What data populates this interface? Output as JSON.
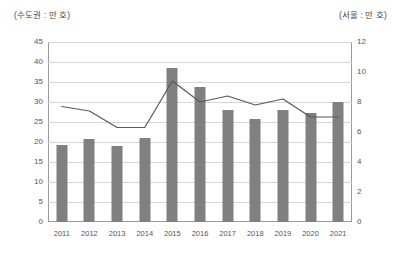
{
  "axis_unit_left": "(수도권 : 만 호)",
  "axis_unit_right": "(서울 : 만 호)",
  "chart_data": {
    "type": "bar",
    "title": "",
    "subtitle": "",
    "xlabel": "",
    "ylabel": "(수도권 : 만 호)",
    "y2label": "(서울 : 만 호)",
    "grid": true,
    "legend": "none",
    "categories": [
      "2011",
      "2012",
      "2013",
      "2014",
      "2015",
      "2016",
      "2017",
      "2018",
      "2019",
      "2020",
      "2021"
    ],
    "ylim": [
      0,
      45
    ],
    "yticks": [
      0,
      5,
      10,
      15,
      20,
      25,
      30,
      35,
      40,
      45
    ],
    "y2lim": [
      0,
      12
    ],
    "y2ticks": [
      0,
      2,
      4,
      6,
      8,
      10,
      12
    ],
    "series": [
      {
        "name": "수도권",
        "type": "bar",
        "axis": "left",
        "color": "#808080",
        "values": [
          19.3,
          20.7,
          19.0,
          21.0,
          38.5,
          33.7,
          28.0,
          25.8,
          28.1,
          27.2,
          30.1
        ]
      },
      {
        "name": "서울",
        "type": "line",
        "axis": "right",
        "color": "#595959",
        "values": [
          7.7,
          7.4,
          6.3,
          6.3,
          9.4,
          8.0,
          8.4,
          7.8,
          8.2,
          7.0,
          7.0
        ]
      }
    ]
  }
}
